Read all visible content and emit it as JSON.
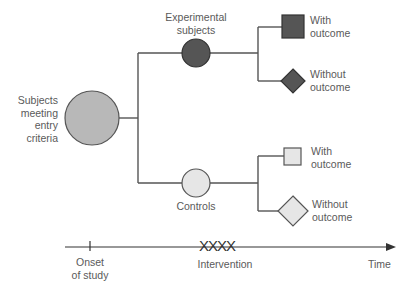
{
  "diagram": {
    "type": "cohort-study-flow",
    "root": {
      "label_lines": [
        "Subjects",
        "meeting",
        "entry",
        "criteria"
      ]
    },
    "groups": [
      {
        "name": "Experimental subjects",
        "label_lines": [
          "Experimental",
          "subjects"
        ],
        "color": "#555555",
        "outcomes": [
          {
            "label_lines": [
              "With",
              "outcome"
            ],
            "shape": "square"
          },
          {
            "label_lines": [
              "Without",
              "outcome"
            ],
            "shape": "diamond"
          }
        ]
      },
      {
        "name": "Controls",
        "label_lines": [
          "Controls"
        ],
        "color": "#e6e6e6",
        "outcomes": [
          {
            "label_lines": [
              "With",
              "outcome"
            ],
            "shape": "square"
          },
          {
            "label_lines": [
              "Without",
              "outcome"
            ],
            "shape": "diamond"
          }
        ]
      }
    ],
    "timeline": {
      "onset_lines": [
        "Onset",
        "of study"
      ],
      "intervention": "Intervention",
      "intervention_marks": "XXXX",
      "axis_label": "Time"
    },
    "colors": {
      "root": "#b8b8b8",
      "experimental": "#555555",
      "control": "#e6e6e6",
      "line": "#555555"
    }
  }
}
